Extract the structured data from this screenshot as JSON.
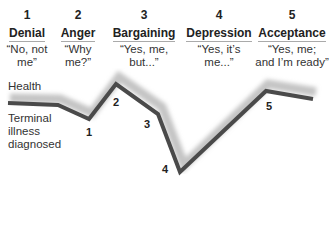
{
  "stages": [
    {
      "number": "1",
      "name": "Denial",
      "quote_line1": "“No, not",
      "quote_line2": "me”"
    },
    {
      "number": "2",
      "name": "Anger",
      "quote_line1": "“Why",
      "quote_line2": "me?”"
    },
    {
      "number": "3",
      "name": "Bargaining",
      "quote_line1": "“Yes, me,",
      "quote_line2": "but...”"
    },
    {
      "number": "4",
      "name": "Depression",
      "quote_line1": "“Yes, it’s",
      "quote_line2": "me...”"
    },
    {
      "number": "5",
      "name": "Acceptance",
      "quote_line1": "“Yes, me;",
      "quote_line2": "and I’m ready”"
    }
  ],
  "labels": {
    "health": "Health",
    "diagnosis_line1": "Terminal",
    "diagnosis_line2": "illness",
    "diagnosis_line3": "diagnosed"
  },
  "points": [
    {
      "label": "1"
    },
    {
      "label": "2"
    },
    {
      "label": "3"
    },
    {
      "label": "4"
    },
    {
      "label": "5"
    }
  ],
  "colors": {
    "line": "#4a4a4a",
    "shadow": "#bdbdbd"
  }
}
